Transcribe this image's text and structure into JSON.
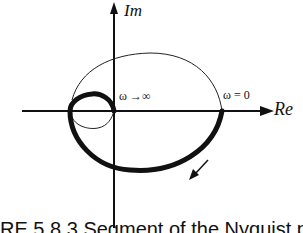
{
  "diagram": {
    "type": "nyquist_plot",
    "axes": {
      "vertical_label": "Im",
      "horizontal_label": "Re"
    },
    "annotations": {
      "omega_infinity": "ω →∞",
      "omega_zero": "ω = 0"
    },
    "curves": [
      {
        "name": "positive-frequency-contour",
        "style": "thick"
      },
      {
        "name": "negative-frequency-contour",
        "style": "thin"
      }
    ],
    "direction_arrow": "down-left",
    "caption": "RE 5.8.3    Segment of the Nyquist plot"
  }
}
